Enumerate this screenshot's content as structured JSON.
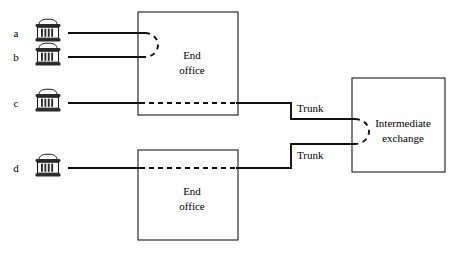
{
  "figure": {
    "background_color": "#ffffff",
    "line_color": "#111111",
    "text_color": "#000000"
  },
  "endpoints": [
    {
      "id": "a",
      "label": "a",
      "icon": "telephone-icon"
    },
    {
      "id": "b",
      "label": "b",
      "icon": "telephone-icon"
    },
    {
      "id": "c",
      "label": "c",
      "icon": "telephone-icon"
    },
    {
      "id": "d",
      "label": "d",
      "icon": "telephone-icon"
    }
  ],
  "nodes": [
    {
      "id": "end-office-upper",
      "line1": "End",
      "line2": "office"
    },
    {
      "id": "end-office-lower",
      "line1": "End",
      "line2": "office"
    },
    {
      "id": "intermediate-exchange",
      "line1": "Intermediate",
      "line2": "exchange"
    }
  ],
  "trunks": [
    {
      "id": "trunk-upper",
      "label": "Trunk"
    },
    {
      "id": "trunk-lower",
      "label": "Trunk"
    }
  ]
}
